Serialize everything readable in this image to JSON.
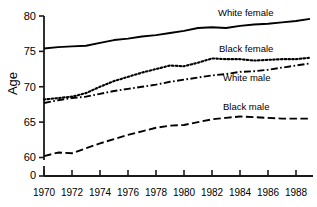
{
  "chart_data": {
    "type": "line",
    "title": "",
    "xlabel": "",
    "ylabel": "Age",
    "xlim": [
      1970,
      1989
    ],
    "ylim": [
      60,
      80
    ],
    "y_axis_break": true,
    "y_zero_tick": "0",
    "grid": false,
    "legend_position": "inline-right",
    "x": [
      1970,
      1971,
      1972,
      1973,
      1974,
      1975,
      1976,
      1977,
      1978,
      1979,
      1980,
      1981,
      1982,
      1983,
      1984,
      1985,
      1986,
      1987,
      1988,
      1989
    ],
    "xticks": [
      1970,
      1972,
      1974,
      1976,
      1978,
      1980,
      1982,
      1984,
      1986,
      1988
    ],
    "yticks": [
      60,
      65,
      70,
      75,
      80
    ],
    "series": [
      {
        "name": "White female",
        "style": "solid",
        "color": "#000000",
        "values": [
          75.4,
          75.6,
          75.7,
          75.8,
          76.2,
          76.6,
          76.8,
          77.1,
          77.3,
          77.6,
          77.9,
          78.3,
          78.4,
          78.3,
          78.6,
          78.8,
          78.9,
          79.1,
          79.3,
          79.6
        ]
      },
      {
        "name": "Black female",
        "style": "dotted",
        "color": "#000000",
        "values": [
          68.2,
          68.4,
          68.6,
          69.1,
          70.0,
          70.8,
          71.4,
          72.0,
          72.5,
          73.0,
          72.9,
          73.4,
          74.0,
          73.9,
          73.9,
          73.7,
          73.8,
          73.9,
          73.9,
          74.1
        ]
      },
      {
        "name": "White male",
        "style": "dashdot",
        "color": "#000000",
        "values": [
          67.7,
          68.1,
          68.4,
          68.6,
          69.0,
          69.4,
          69.7,
          70.0,
          70.3,
          70.7,
          71.0,
          71.3,
          71.6,
          71.8,
          72.1,
          72.2,
          72.4,
          72.7,
          73.0,
          73.3
        ]
      },
      {
        "name": "Black male",
        "style": "dashed",
        "color": "#000000",
        "values": [
          60.2,
          60.7,
          60.6,
          61.3,
          62.0,
          62.6,
          63.2,
          63.7,
          64.2,
          64.5,
          64.6,
          65.0,
          65.4,
          65.6,
          65.8,
          65.7,
          65.6,
          65.5,
          65.5,
          65.5
        ]
      }
    ],
    "annotations": [
      {
        "text": "White female",
        "x": 1983.0,
        "y": 80.3
      },
      {
        "text": "Black female",
        "x": 1983.0,
        "y": 75.3
      },
      {
        "text": "White male",
        "x": 1983.4,
        "y": 71.3
      },
      {
        "text": "Black male",
        "x": 1983.4,
        "y": 67.1
      }
    ]
  },
  "axis": {
    "ylabel": "Age",
    "yticks": [
      "80",
      "75",
      "70",
      "65",
      "60",
      "0"
    ],
    "xticks": [
      "1970",
      "1972",
      "1974",
      "1976",
      "1978",
      "1980",
      "1982",
      "1984",
      "1986",
      "1988"
    ]
  },
  "legend": {
    "white_female": "White female",
    "black_female": "Black female",
    "white_male": "White male",
    "black_male": "Black male"
  }
}
